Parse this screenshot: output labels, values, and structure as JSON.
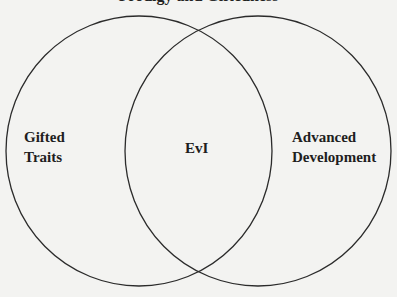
{
  "diagram": {
    "type": "venn",
    "title_partial": "Prodigy and Giftedness",
    "sets": [
      {
        "id": "left",
        "label_line1": "Gifted",
        "label_line2": "Traits"
      },
      {
        "id": "right",
        "label_line1": "Advanced",
        "label_line2": "Development"
      }
    ],
    "intersection": {
      "label": "EvI"
    },
    "colors": {
      "background": "#f3f3f1",
      "stroke": "#2b2b2b",
      "text": "#1e1e1e"
    }
  }
}
